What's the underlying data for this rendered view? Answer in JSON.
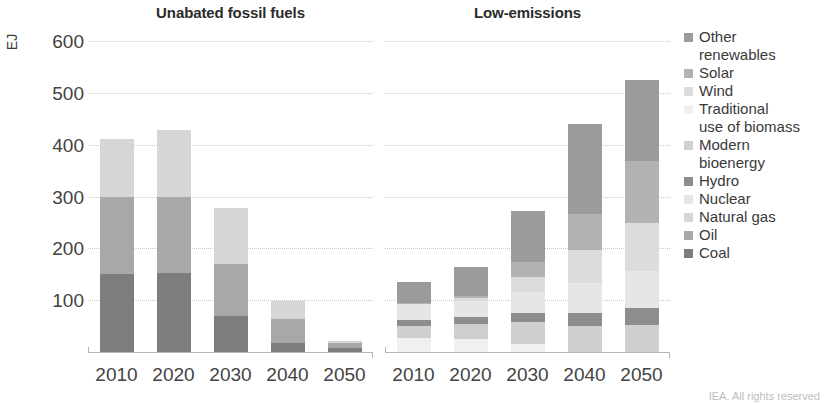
{
  "footer": {
    "credit": "IEA. All rights reserved"
  },
  "axis": {
    "ylabel": "EJ",
    "yticks": [
      "600",
      "500",
      "400",
      "300",
      "200",
      "100"
    ],
    "ymin": 0,
    "ymax": 600
  },
  "panels": [
    {
      "title": "Unabated fossil fuels"
    },
    {
      "title": "Low-emissions"
    }
  ],
  "legend": {
    "items": [
      {
        "label": "Other\nrenewables",
        "color": "#9b9b9b"
      },
      {
        "label": "Solar",
        "color": "#b2b2b2"
      },
      {
        "label": "Wind",
        "color": "#dcdcdc"
      },
      {
        "label": "Traditional\nuse of biomass",
        "color": "#f0f0f0"
      },
      {
        "label": "Modern\nbioenergy",
        "color": "#cfcfcf"
      },
      {
        "label": "Hydro",
        "color": "#8d8d8d"
      },
      {
        "label": "Nuclear",
        "color": "#e6e6e6"
      },
      {
        "label": "Natural gas",
        "color": "#d6d6d6"
      },
      {
        "label": "Oil",
        "color": "#a8a8a8"
      },
      {
        "label": "Coal",
        "color": "#7d7d7d"
      }
    ]
  },
  "chart_data": {
    "type": "bar",
    "title": "",
    "xlabel": "",
    "ylabel": "EJ",
    "ylim": [
      0,
      600
    ],
    "grid": true,
    "legend_position": "right",
    "stacked": true,
    "panels": [
      {
        "title": "Unabated fossil fuels",
        "categories": [
          "2010",
          "2020",
          "2030",
          "2040",
          "2050"
        ],
        "series": [
          {
            "name": "Coal",
            "color": "#7d7d7d",
            "values": [
              150,
              152,
              70,
              18,
              8
            ]
          },
          {
            "name": "Oil",
            "color": "#a8a8a8",
            "values": [
              150,
              148,
              100,
              45,
              10
            ]
          },
          {
            "name": "Natural gas",
            "color": "#d6d6d6",
            "values": [
              110,
              128,
              108,
              35,
              4
            ]
          }
        ],
        "totals": [
          410,
          428,
          278,
          98,
          22
        ]
      },
      {
        "title": "Low-emissions",
        "categories": [
          "2010",
          "2020",
          "2030",
          "2040",
          "2050"
        ],
        "series": [
          {
            "name": "Traditional use of biomass",
            "color": "#f0f0f0",
            "values": [
              28,
              26,
              15,
              0,
              0
            ]
          },
          {
            "name": "Modern bioenergy",
            "color": "#cfcfcf",
            "values": [
              22,
              28,
              42,
              50,
              52
            ]
          },
          {
            "name": "Hydro",
            "color": "#8d8d8d",
            "values": [
              12,
              14,
              18,
              26,
              32
            ]
          },
          {
            "name": "Nuclear",
            "color": "#e6e6e6",
            "values": [
              30,
              30,
              40,
              58,
              72
            ]
          },
          {
            "name": "Wind",
            "color": "#dcdcdc",
            "values": [
              2,
              6,
              30,
              62,
              92
            ]
          },
          {
            "name": "Solar",
            "color": "#b2b2b2",
            "values": [
              1,
              5,
              28,
              70,
              120
            ]
          },
          {
            "name": "Other renewables",
            "color": "#9b9b9b",
            "values": [
              40,
              56,
              99,
              174,
              157
            ]
          }
        ],
        "totals": [
          135,
          165,
          272,
          440,
          525
        ]
      }
    ]
  }
}
